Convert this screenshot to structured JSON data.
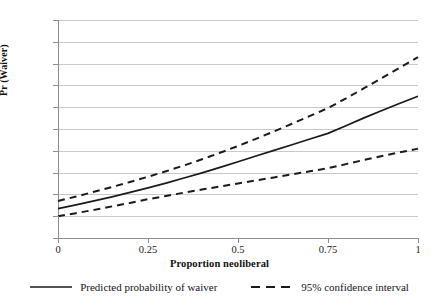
{
  "chart_data": {
    "type": "line",
    "title": "",
    "xlabel": "Proportion neoliberal",
    "ylabel": "Pr (Waiver)",
    "xlim": [
      0,
      1
    ],
    "ylim": [
      0,
      1
    ],
    "grid": true,
    "legend_position": "bottom",
    "x_ticks": [
      "0",
      "0.25",
      "0.5",
      "0.75",
      "1"
    ],
    "x_tick_values": [
      0,
      0.25,
      0.5,
      0.75,
      1
    ],
    "y_ticks": [
      "0",
      "0.1",
      "0.2",
      "0.3",
      "0.4",
      "0.5",
      "0.6",
      "0.7",
      "0.8",
      "0.9",
      "1"
    ],
    "y_tick_values": [
      0,
      0.1,
      0.2,
      0.3,
      0.4,
      0.5,
      0.6,
      0.7,
      0.8,
      0.9,
      1
    ],
    "x": [
      0,
      0.05,
      0.1,
      0.15,
      0.2,
      0.25,
      0.3,
      0.35,
      0.4,
      0.45,
      0.5,
      0.55,
      0.6,
      0.65,
      0.7,
      0.75,
      0.8,
      0.85,
      0.9,
      0.95,
      1
    ],
    "series": [
      {
        "name": "Predicted probability of waiver",
        "style": "solid",
        "color": "#1a1a1a",
        "values": [
          0.135,
          0.152,
          0.17,
          0.189,
          0.209,
          0.23,
          0.252,
          0.275,
          0.299,
          0.324,
          0.35,
          0.376,
          0.402,
          0.428,
          0.454,
          0.48,
          0.515,
          0.551,
          0.585,
          0.618,
          0.65
        ]
      },
      {
        "name": "95% confidence interval upper",
        "style": "dashed",
        "color": "#1a1a1a",
        "values": [
          0.17,
          0.19,
          0.212,
          0.234,
          0.257,
          0.281,
          0.306,
          0.333,
          0.361,
          0.391,
          0.422,
          0.455,
          0.489,
          0.524,
          0.56,
          0.596,
          0.64,
          0.687,
          0.734,
          0.782,
          0.83
        ]
      },
      {
        "name": "95% confidence interval lower",
        "style": "dashed",
        "color": "#1a1a1a",
        "values": [
          0.1,
          0.114,
          0.129,
          0.145,
          0.161,
          0.178,
          0.193,
          0.208,
          0.222,
          0.236,
          0.25,
          0.264,
          0.278,
          0.292,
          0.306,
          0.32,
          0.339,
          0.358,
          0.376,
          0.393,
          0.41
        ]
      }
    ],
    "legend": [
      {
        "label": "Predicted probability of waiver",
        "style": "solid"
      },
      {
        "label": "95% confidence interval",
        "style": "dashed"
      }
    ]
  },
  "colors": {
    "gridline": "#c9c9c9",
    "axis": "#8d8d8d",
    "line": "#1a1a1a",
    "background": "#ffffff"
  }
}
